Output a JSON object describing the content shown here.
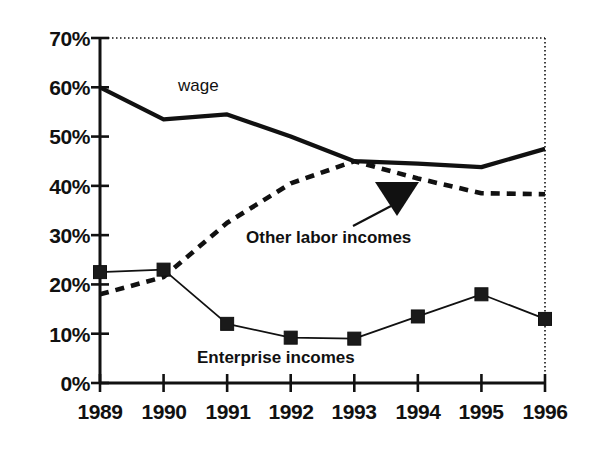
{
  "chart_data": {
    "type": "line",
    "title": "",
    "subtitle": "",
    "xlabel": "",
    "ylabel": "",
    "x": [
      "1989",
      "1990",
      "1991",
      "1992",
      "1993",
      "1994",
      "1995",
      "1996"
    ],
    "categories": [
      "1989",
      "1990",
      "1991",
      "1992",
      "1993",
      "1994",
      "1995",
      "1996"
    ],
    "xlim": [
      "1989",
      "1996"
    ],
    "ylim": [
      0,
      70
    ],
    "ytick_values": [
      0,
      10,
      20,
      30,
      40,
      50,
      60,
      70
    ],
    "ytick_labels": [
      "0%",
      "10%",
      "20%",
      "30%",
      "40%",
      "50%",
      "60%",
      "70%"
    ],
    "xtick_labels": [
      "1989",
      "1990",
      "1991",
      "1992",
      "1993",
      "1994",
      "1995",
      "1996"
    ],
    "grid": false,
    "top_border_style": "dotted",
    "right_border_style": "dotted",
    "legend_position": "inline-annotations",
    "series": [
      {
        "name": "wage",
        "style": "solid-thick",
        "marker": "none",
        "color": "#111111",
        "values": [
          60.0,
          53.5,
          54.5,
          50.0,
          45.0,
          44.5,
          43.8,
          47.5
        ]
      },
      {
        "name": "Other labor incomes",
        "style": "dashed",
        "marker": "none",
        "color": "#111111",
        "values": [
          18.0,
          21.5,
          32.5,
          40.5,
          45.0,
          41.5,
          38.5,
          38.3
        ]
      },
      {
        "name": "Enterprise incomes",
        "style": "solid-thin",
        "marker": "square",
        "color": "#111111",
        "values": [
          22.5,
          23.0,
          12.0,
          9.2,
          9.0,
          13.5,
          18.0,
          13.0
        ]
      }
    ],
    "annotations": [
      {
        "name": "wage-label",
        "text": "wage",
        "target_series": "wage",
        "x_frac": 0.26,
        "y_value": 61.5
      },
      {
        "name": "other-labor-incomes-label",
        "text": "Other labor incomes",
        "target_series": "Other labor incomes",
        "x_frac": 0.4,
        "y_value": 27.5,
        "arrow": {
          "name": "arrow-to-other-labor-incomes",
          "shape": "triangle-down",
          "from_x": 353,
          "from_y": 226,
          "to_x": 397,
          "to_y": 200
        }
      },
      {
        "name": "enterprise-incomes-label",
        "text": "Enterprise incomes",
        "target_series": "Enterprise incomes",
        "x_frac": 0.34,
        "y_value": 3.5
      }
    ]
  },
  "axes": {
    "y_labels": [
      "70%",
      "60%",
      "50%",
      "40%",
      "30%",
      "20%",
      "10%",
      "0%"
    ],
    "x_labels": [
      "1989",
      "1990",
      "1991",
      "1992",
      "1993",
      "1994",
      "1995",
      "1996"
    ]
  },
  "labels": {
    "wage": "wage",
    "other_labor_incomes": "Other labor incomes",
    "enterprise_incomes": "Enterprise incomes"
  },
  "colors": {
    "ink": "#111111",
    "background": "#ffffff",
    "marker_fill": "#1a1a1a"
  }
}
